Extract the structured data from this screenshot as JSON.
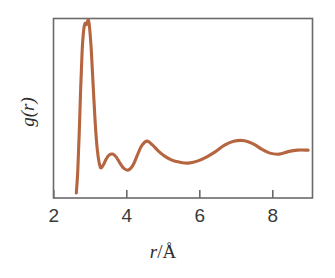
{
  "figure": {
    "background_color": "#ffffff",
    "frame_color": "#6a6a6a",
    "curve_color": "#b5653f",
    "tick_label_color": "#3a3a3a"
  },
  "axes": {
    "x": {
      "label_italic_part": "r",
      "label_sep": "/",
      "label_unit": "Å",
      "label_full": "r/Å",
      "ticks": [
        "2",
        "4",
        "6",
        "8"
      ],
      "tick_values": [
        2,
        4,
        6,
        8
      ],
      "range": [
        2.0,
        9.12
      ]
    },
    "y": {
      "label_italic_part": "g",
      "label_rest": "(r)",
      "label_full": "g(r)",
      "ticks": [],
      "range": [
        0,
        1
      ]
    }
  },
  "chart_data": {
    "type": "line",
    "title": "",
    "subtitle": "",
    "xlabel": "r/Å",
    "ylabel": "g(r)",
    "xlim": [
      2.0,
      9.12
    ],
    "ylim": [
      0.0,
      3.6
    ],
    "grid": false,
    "legend": "none",
    "series": [
      {
        "name": "g(r)",
        "color": "#b5653f",
        "x": [
          2.62,
          2.66,
          2.7,
          2.74,
          2.78,
          2.82,
          2.86,
          2.9,
          2.96,
          3.02,
          3.08,
          3.14,
          3.2,
          3.28,
          3.36,
          3.44,
          3.52,
          3.62,
          3.72,
          3.82,
          3.92,
          4.05,
          4.18,
          4.3,
          4.42,
          4.57,
          4.72,
          4.88,
          5.05,
          5.25,
          5.45,
          5.7,
          5.95,
          6.2,
          6.45,
          6.7,
          6.95,
          7.25,
          7.5,
          7.72,
          7.95,
          8.2,
          8.45,
          8.7,
          9.0
        ],
        "y": [
          0.1,
          0.55,
          1.3,
          2.2,
          2.95,
          3.35,
          3.5,
          3.48,
          3.55,
          3.1,
          2.3,
          1.5,
          0.95,
          0.62,
          0.66,
          0.78,
          0.86,
          0.88,
          0.82,
          0.7,
          0.6,
          0.56,
          0.66,
          0.86,
          1.05,
          1.14,
          1.06,
          0.94,
          0.84,
          0.76,
          0.72,
          0.7,
          0.74,
          0.82,
          0.93,
          1.06,
          1.14,
          1.15,
          1.08,
          0.98,
          0.9,
          0.88,
          0.93,
          0.96,
          0.96
        ],
        "annotations": [
          {
            "feature": "first-peak",
            "r": 2.96,
            "g": 3.55
          },
          {
            "feature": "first-minimum",
            "r": 3.3,
            "g": 0.62
          },
          {
            "feature": "shoulder-bump",
            "r": 3.65,
            "g": 0.88
          },
          {
            "feature": "second-minimum",
            "r": 4.05,
            "g": 0.56
          },
          {
            "feature": "second-peak",
            "r": 4.57,
            "g": 1.14
          },
          {
            "feature": "broad-minimum",
            "r": 5.7,
            "g": 0.7
          },
          {
            "feature": "third-broad-peak",
            "r": 7.2,
            "g": 1.15
          },
          {
            "feature": "curve-start",
            "r": 2.62,
            "g": 0.1
          },
          {
            "feature": "curve-end",
            "r": 9.0,
            "g": 0.96
          }
        ]
      }
    ]
  }
}
